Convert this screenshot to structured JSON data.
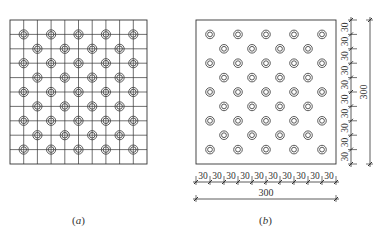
{
  "figure_a": {
    "caption": "(a)",
    "caption_letter": "a",
    "grid": {
      "cols": 10,
      "rows": 10
    },
    "pattern": "staggered circles at grid intersections, 5 per odd row, 4 per even row, 9 rows"
  },
  "figure_b": {
    "caption": "(b)",
    "caption_letter": "b",
    "bottom_segments": [
      "30",
      "30",
      "30",
      "30",
      "30",
      "30",
      "30",
      "30",
      "30",
      "30"
    ],
    "bottom_total": "300",
    "right_segments": [
      "30",
      "30",
      "30",
      "30",
      "30",
      "30",
      "30",
      "30",
      "30",
      "30"
    ],
    "right_total": "300",
    "pattern": "staggered double circles, 5 per odd row, 4 per even row, 9 rows"
  },
  "colors": {
    "line": "#333333",
    "background": "#ffffff"
  }
}
